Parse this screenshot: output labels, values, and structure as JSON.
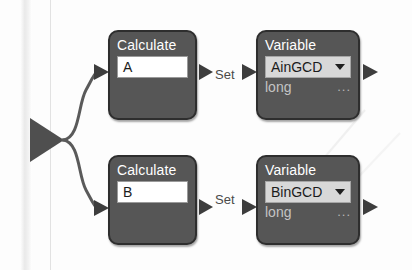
{
  "diagram": {
    "background_color": "#fdfdfd",
    "block_fill": "#565656",
    "block_border": "#2e2e2e",
    "field_fill": "#ffffff",
    "combo_fill": "#d8d8d8",
    "connector_color": "#5a5a5a",
    "branches": [
      {
        "id": "branch-a",
        "calculate": {
          "title": "Calculate",
          "expression": "A"
        },
        "connector_label": "Set",
        "variable": {
          "title": "Variable",
          "name": "AinGCD",
          "type": "long",
          "overflow_label": "...",
          "dropdown_icon": "chevron-down-icon"
        }
      },
      {
        "id": "branch-b",
        "calculate": {
          "title": "Calculate",
          "expression": "B"
        },
        "connector_label": "Set",
        "variable": {
          "title": "Variable",
          "name": "BinGCD",
          "type": "long",
          "overflow_label": "...",
          "dropdown_icon": "chevron-down-icon"
        }
      }
    ],
    "connectors": {
      "source_icon": "flow-start-triangle-icon",
      "input_arrow_icon": "arrow-right-icon",
      "output_arrow_icon": "arrow-right-icon"
    }
  }
}
